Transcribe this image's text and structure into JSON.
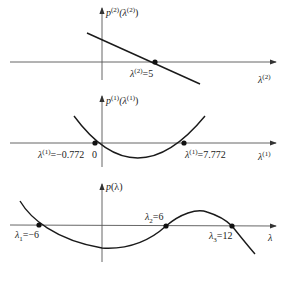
{
  "colors": {
    "curve": "#1a1a1a",
    "axis": "#555555",
    "point": "#111111",
    "background": "#ffffff"
  },
  "panels": [
    {
      "id": "top",
      "type": "line",
      "y_axis_label": {
        "base": "p",
        "sup": "(2)",
        "arg": "(λ",
        "arg_sup": "(2)",
        "close": ")"
      },
      "x_axis_label": {
        "base": "λ",
        "sup": "(2)"
      },
      "roots": [
        {
          "label_base": "λ",
          "label_sub": "1",
          "label_sup": "(2)",
          "value_text": "=5",
          "value": 5
        }
      ]
    },
    {
      "id": "middle",
      "type": "parabola",
      "y_axis_label": {
        "base": "p",
        "sup": "(1)",
        "arg": "(λ",
        "arg_sup": "(1)",
        "close": ")"
      },
      "x_axis_label": {
        "base": "λ",
        "sup": "(1)"
      },
      "origin_label": "0",
      "roots": [
        {
          "label_base": "λ",
          "label_sub": "1",
          "label_sup": "(1)",
          "value_text": "=−0.772",
          "value": -0.772
        },
        {
          "label_base": "λ",
          "label_sub": "2",
          "label_sup": "(1)",
          "value_text": "=7.772",
          "value": 7.772
        }
      ]
    },
    {
      "id": "bottom",
      "type": "cubic",
      "y_axis_label": {
        "base": "p",
        "arg": "(λ)"
      },
      "x_axis_label": {
        "base": "λ"
      },
      "roots": [
        {
          "label_base": "λ",
          "label_sub": "1",
          "value_text": "=−6",
          "value": -6
        },
        {
          "label_base": "λ",
          "label_sub": "2",
          "value_text": "=6",
          "value": 6
        },
        {
          "label_base": "λ",
          "label_sub": "3",
          "value_text": "=12",
          "value": 12
        }
      ]
    }
  ]
}
